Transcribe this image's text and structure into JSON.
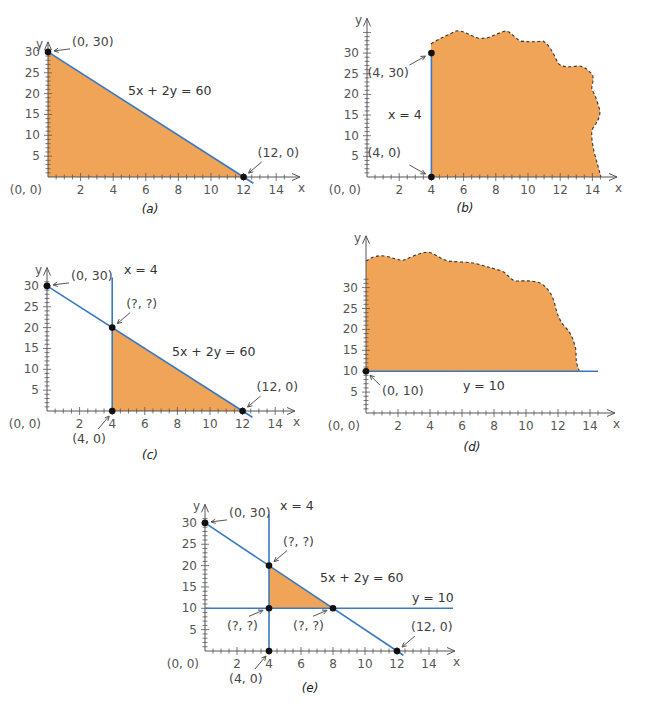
{
  "chart_data": [
    {
      "id": "a",
      "type": "area",
      "caption": "(a)",
      "xlabel": "x",
      "ylabel": "y",
      "xlim": [
        0,
        15
      ],
      "ylim": [
        0,
        32
      ],
      "x_ticks": [
        2,
        4,
        6,
        8,
        10,
        12,
        14
      ],
      "y_ticks": [
        5,
        10,
        15,
        20,
        25,
        30
      ],
      "origin_label": "(0, 0)",
      "lines": [
        {
          "equation": "5x + 2y = 60",
          "points": [
            [
              0,
              30
            ],
            [
              12.6,
              -1.5
            ]
          ]
        }
      ],
      "region": {
        "vertices": [
          [
            0,
            0
          ],
          [
            0,
            30
          ],
          [
            12,
            0
          ]
        ],
        "boundary": "solid"
      },
      "points": [
        {
          "xy": [
            0,
            30
          ],
          "label": "(0, 30)"
        },
        {
          "xy": [
            12,
            0
          ],
          "label": "(12, 0)"
        }
      ],
      "geom": {
        "ox": 48,
        "oy": 177,
        "sx": 16.3,
        "sy": 4.17,
        "xend": 300,
        "ytop": 30
      }
    },
    {
      "id": "b",
      "type": "area",
      "caption": "(b)",
      "xlabel": "x",
      "ylabel": "y",
      "xlim": [
        0,
        15
      ],
      "ylim": [
        0,
        34
      ],
      "x_ticks": [
        2,
        4,
        6,
        8,
        10,
        12,
        14
      ],
      "y_ticks": [
        5,
        10,
        15,
        20,
        25,
        30
      ],
      "origin_label": "(0, 0)",
      "lines": [
        {
          "equation": "x = 4",
          "points": [
            [
              4,
              0
            ],
            [
              4,
              30
            ]
          ]
        }
      ],
      "region": {
        "description": "x ≥ 4, unbounded (dashed wavy boundary)",
        "boundary": "dashed"
      },
      "points": [
        {
          "xy": [
            4,
            30
          ],
          "label": "(4, 30)"
        },
        {
          "xy": [
            4,
            0
          ],
          "label": "(4, 0)"
        }
      ],
      "geom": {
        "ox": 367,
        "oy": 177,
        "sx": 16.1,
        "sy": 4.13,
        "xend": 617,
        "ytop": 36
      }
    },
    {
      "id": "c",
      "type": "area",
      "caption": "(c)",
      "xlabel": "x",
      "ylabel": "y",
      "xlim": [
        0,
        15
      ],
      "ylim": [
        0,
        32
      ],
      "x_ticks": [
        2,
        4,
        6,
        8,
        10,
        12,
        14
      ],
      "y_ticks": [
        5,
        10,
        15,
        20,
        25,
        30
      ],
      "origin_label": "(0, 0)",
      "lines": [
        {
          "equation": "x = 4",
          "points": [
            [
              4,
              0
            ],
            [
              4,
              32
            ]
          ]
        },
        {
          "equation": "5x + 2y = 60",
          "points": [
            [
              0,
              30
            ],
            [
              12.6,
              -1.5
            ]
          ]
        }
      ],
      "region": {
        "vertices": [
          [
            4,
            0
          ],
          [
            4,
            20
          ],
          [
            12,
            0
          ]
        ],
        "boundary": "solid"
      },
      "points": [
        {
          "xy": [
            0,
            30
          ],
          "label": "(0, 30)"
        },
        {
          "xy": [
            4,
            20
          ],
          "label": "(?, ?)"
        },
        {
          "xy": [
            12,
            0
          ],
          "label": "(12, 0)"
        },
        {
          "xy": [
            4,
            0
          ],
          "label": "(4, 0)"
        }
      ],
      "geom": {
        "ox": 47,
        "oy": 411,
        "sx": 16.3,
        "sy": 4.17,
        "xend": 295,
        "ytop": 32
      }
    },
    {
      "id": "d",
      "type": "area",
      "caption": "(d)",
      "xlabel": "x",
      "ylabel": "y",
      "xlim": [
        0,
        15
      ],
      "ylim": [
        0,
        38
      ],
      "x_ticks": [
        2,
        4,
        6,
        8,
        10,
        12,
        14
      ],
      "y_ticks": [
        5,
        10,
        15,
        20,
        25,
        30
      ],
      "origin_label": "(0, 0)",
      "lines": [
        {
          "equation": "y = 10",
          "points": [
            [
              0,
              10
            ],
            [
              14.5,
              10
            ]
          ]
        }
      ],
      "region": {
        "description": "y ≥ 10, unbounded (dashed wavy boundary)",
        "boundary": "dashed"
      },
      "points": [
        {
          "xy": [
            0,
            10
          ],
          "label": "(0, 10)"
        }
      ],
      "geom": {
        "ox": 366,
        "oy": 413,
        "sx": 16.0,
        "sy": 4.18,
        "xend": 615,
        "ytop": 40
      }
    },
    {
      "id": "e",
      "type": "area",
      "caption": "(e)",
      "xlabel": "x",
      "ylabel": "y",
      "xlim": [
        0,
        15
      ],
      "ylim": [
        0,
        32
      ],
      "x_ticks": [
        2,
        4,
        6,
        8,
        10,
        12,
        14
      ],
      "y_ticks": [
        5,
        10,
        15,
        20,
        25,
        30
      ],
      "origin_label": "(0, 0)",
      "lines": [
        {
          "equation": "x = 4",
          "points": [
            [
              4,
              0
            ],
            [
              4,
              32
            ]
          ]
        },
        {
          "equation": "5x + 2y = 60",
          "points": [
            [
              0,
              30
            ],
            [
              12.4,
              -1
            ]
          ]
        },
        {
          "equation": "y = 10",
          "points": [
            [
              0,
              10
            ],
            [
              15.5,
              10
            ]
          ]
        }
      ],
      "region": {
        "vertices": [
          [
            4,
            10
          ],
          [
            4,
            20
          ],
          [
            8,
            10
          ]
        ],
        "boundary": "solid"
      },
      "points": [
        {
          "xy": [
            0,
            30
          ],
          "label": "(0, 30)"
        },
        {
          "xy": [
            4,
            20
          ],
          "label": "(?, ?)"
        },
        {
          "xy": [
            4,
            10
          ],
          "label": "(?, ?)"
        },
        {
          "xy": [
            8,
            10
          ],
          "label": "(?, ?)"
        },
        {
          "xy": [
            12,
            0
          ],
          "label": "(12, 0)"
        },
        {
          "xy": [
            4,
            0
          ],
          "label": "(4, 0)"
        }
      ],
      "geom": {
        "ox": 205,
        "oy": 651,
        "sx": 16.0,
        "sy": 4.27,
        "xend": 455,
        "ytop": 32
      }
    }
  ],
  "colors": {
    "region_fill": "#f0a457",
    "constraint_line": "#3a78c0",
    "axis": "#555555",
    "point": "#111111"
  }
}
